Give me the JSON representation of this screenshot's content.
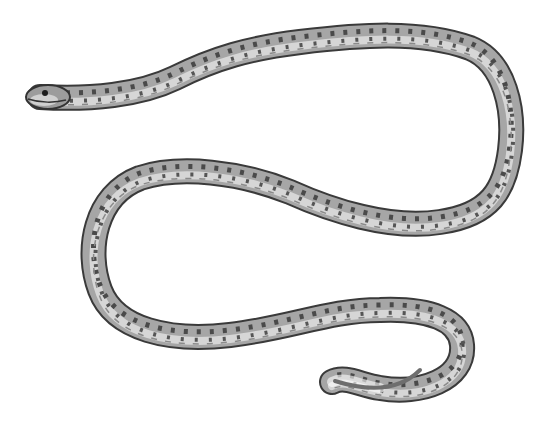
{
  "image": {
    "subject": "spotted snake illustration",
    "background_color": "#ffffff",
    "body_color": "#a9a9a9",
    "belly_color": "#d9d9d9",
    "outline_color": "#3a3a3a",
    "spot_color": "#4a4a4a"
  }
}
